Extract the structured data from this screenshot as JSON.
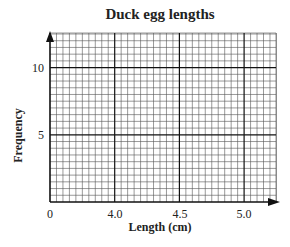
{
  "chart_data": {
    "type": "bar",
    "title": "Duck egg lengths",
    "xlabel": "Length (cm)",
    "ylabel": "Frequency",
    "x_ticks": [
      "0",
      "4.0",
      "4.5",
      "5.0"
    ],
    "y_ticks": [
      "5",
      "10"
    ],
    "xlim": [
      3.5,
      5.25
    ],
    "ylim": [
      0,
      12.5
    ],
    "x_axis_broken": true,
    "grid": true,
    "grid_minor_x": 0.05,
    "grid_minor_y": 0.5,
    "series": [],
    "note": "Empty graph paper grid; no data plotted"
  }
}
